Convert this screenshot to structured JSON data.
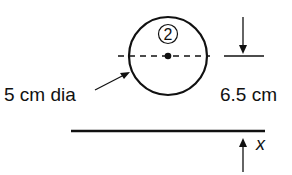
{
  "diagram": {
    "circle_label": "2",
    "diameter_label": "5 cm dia",
    "distance_label": "6.5 cm",
    "axis_label": "x"
  }
}
